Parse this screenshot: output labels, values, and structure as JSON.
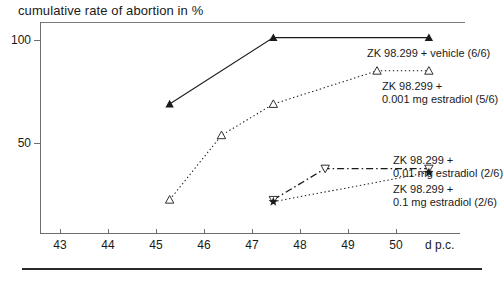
{
  "chart_data": {
    "type": "line",
    "title": "cumulative rate of abortion in %",
    "xlabel": "d p.c.",
    "ylabel": "cumulative rate of abortion in %",
    "xlim": [
      42.5,
      50.6
    ],
    "ylim": [
      0,
      108
    ],
    "xticks": [
      43,
      44,
      45,
      46,
      47,
      48,
      49,
      50
    ],
    "xticklabels": [
      "43",
      "44",
      "45",
      "46",
      "47",
      "48",
      "49",
      "50"
    ],
    "yticks": [
      50,
      100
    ],
    "yticklabels": [
      "50",
      "100"
    ],
    "grid": false,
    "legend_position": "right-inline",
    "series": [
      {
        "name": "ZK 98.299 + vehicle (6/6)",
        "marker": "filled-triangle",
        "linestyle": "solid",
        "color": "#1a1a1a",
        "x": [
          45,
          47,
          50
        ],
        "y": [
          66,
          100,
          100
        ]
      },
      {
        "name": "ZK 98.299 + 0.001 mg estradiol (5/6)",
        "marker": "open-triangle",
        "linestyle": "dotted",
        "color": "#1a1a1a",
        "x": [
          45,
          46,
          47,
          49,
          50
        ],
        "y": [
          17,
          50,
          66,
          83,
          83
        ]
      },
      {
        "name": "ZK 98.299 + 0.01 mg estradiol (2/6)",
        "marker": "open-inverted-triangle",
        "linestyle": "dash-dot",
        "color": "#1a1a1a",
        "x": [
          47,
          48,
          50
        ],
        "y": [
          17,
          33,
          33
        ]
      },
      {
        "name": "ZK 98.299 + 0.1 mg estradiol (2/6)",
        "marker": "filled-star",
        "linestyle": "dotted",
        "color": "#1a1a1a",
        "x": [
          47,
          50
        ],
        "y": [
          16,
          31
        ]
      }
    ]
  },
  "legend": [
    {
      "id": "legend-vehicle",
      "line1": "ZK 98.299 + vehicle (6/6)",
      "line2": ""
    },
    {
      "id": "legend-estradiol-0001",
      "line1": "ZK 98.299 +",
      "line2": "0.001 mg estradiol (5/6)"
    },
    {
      "id": "legend-estradiol-001",
      "line1": "ZK 98.299 +",
      "line2": "0.01 mg estradiol (2/6)"
    },
    {
      "id": "legend-estradiol-01",
      "line1": "ZK 98.299 +",
      "line2": "0.1 mg estradiol (2/6)"
    }
  ]
}
